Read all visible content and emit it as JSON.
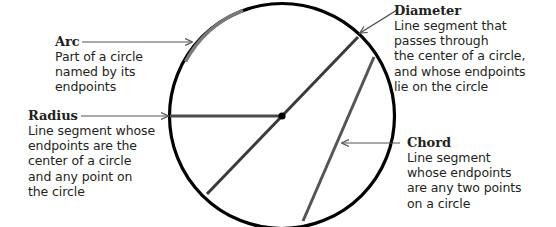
{
  "figure": {
    "colors": {
      "circle": "#000000",
      "segment": "#4a4a4a",
      "arc_highlight": "#7a7a7a",
      "arrow": "#555555",
      "text": "#231f20"
    },
    "labels": {
      "arc": {
        "title": "Arc",
        "description": "Part of a circle\nnamed by its\nendpoints"
      },
      "radius": {
        "title": "Radius",
        "description": "Line segment whose\nendpoints are the\ncenter of a circle\nand any point on\nthe circle"
      },
      "diameter": {
        "title": "Diameter",
        "description": "Line segment that\npasses through\nthe center of a circle,\nand whose endpoints\nlie on the circle"
      },
      "chord": {
        "title": "Chord",
        "description": "Line segment\nwhose endpoints\nare any two points\non a circle"
      }
    }
  }
}
